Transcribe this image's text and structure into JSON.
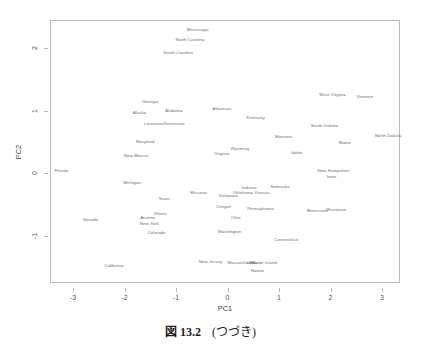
{
  "caption": {
    "figure_word": "図",
    "number": "13.2",
    "note": "(つづき)"
  },
  "chart_data": {
    "type": "scatter",
    "title": "",
    "xlabel": "PC1",
    "ylabel": "PC2",
    "xlim": [
      -3.45,
      3.35
    ],
    "ylim": [
      -1.75,
      2.45
    ],
    "xticks": [
      -3,
      -2,
      -1,
      0,
      1,
      2,
      3
    ],
    "xticklabels": [
      "-3",
      "-2",
      "-1",
      "0",
      "1",
      "2",
      "3"
    ],
    "yticks": [
      -1,
      0,
      1,
      2
    ],
    "yticklabels": [
      "-1",
      "0",
      "1",
      "2"
    ],
    "grid": false,
    "legend": false,
    "marker": "text-label",
    "points": [
      {
        "label": "Mississippi",
        "x": -0.6,
        "y": 2.31
      },
      {
        "label": "North Carolina",
        "x": -0.75,
        "y": 2.14
      },
      {
        "label": "South Carolina",
        "x": -0.98,
        "y": 1.94
      },
      {
        "label": "West Virginia",
        "x": 2.02,
        "y": 1.27
      },
      {
        "label": "Vermont",
        "x": 2.65,
        "y": 1.24
      },
      {
        "label": "Georgia",
        "x": -1.52,
        "y": 1.15
      },
      {
        "label": "Alabama",
        "x": -1.06,
        "y": 1.02
      },
      {
        "label": "Arkansas",
        "x": -0.13,
        "y": 1.05
      },
      {
        "label": "Alaska",
        "x": -1.73,
        "y": 0.98
      },
      {
        "label": "Kentucky",
        "x": 0.53,
        "y": 0.9
      },
      {
        "label": "Louisiana",
        "x": -1.45,
        "y": 0.81
      },
      {
        "label": "Tennessee",
        "x": -1.06,
        "y": 0.81
      },
      {
        "label": "South Dakota",
        "x": 1.86,
        "y": 0.78
      },
      {
        "label": "North Dakota",
        "x": 3.1,
        "y": 0.62
      },
      {
        "label": "Montana",
        "x": 1.07,
        "y": 0.6
      },
      {
        "label": "Maryland",
        "x": -1.62,
        "y": 0.52
      },
      {
        "label": "Maine",
        "x": 2.26,
        "y": 0.5
      },
      {
        "label": "Wyoming",
        "x": 0.22,
        "y": 0.4
      },
      {
        "label": "Idaho",
        "x": 1.32,
        "y": 0.34
      },
      {
        "label": "Virginia",
        "x": -0.13,
        "y": 0.32
      },
      {
        "label": "New Mexico",
        "x": -1.8,
        "y": 0.29
      },
      {
        "label": "Florida",
        "x": -3.25,
        "y": 0.05
      },
      {
        "label": "New Hampshire",
        "x": 2.04,
        "y": 0.06
      },
      {
        "label": "Iowa",
        "x": 2.0,
        "y": -0.04
      },
      {
        "label": "Michigan",
        "x": -1.87,
        "y": -0.14
      },
      {
        "label": "Indiana",
        "x": 0.4,
        "y": -0.21
      },
      {
        "label": "Nebraska",
        "x": 1.0,
        "y": -0.2
      },
      {
        "label": "Kansas",
        "x": 0.66,
        "y": -0.29
      },
      {
        "label": "Oklahoma",
        "x": 0.28,
        "y": -0.3
      },
      {
        "label": "Delaware",
        "x": 0.0,
        "y": -0.34
      },
      {
        "label": "Missouri",
        "x": -0.58,
        "y": -0.3
      },
      {
        "label": "Texas",
        "x": -1.25,
        "y": -0.4
      },
      {
        "label": "Oregon",
        "x": -0.1,
        "y": -0.52
      },
      {
        "label": "Pennsylvania",
        "x": 0.62,
        "y": -0.55
      },
      {
        "label": "Minnesota",
        "x": 1.72,
        "y": -0.58
      },
      {
        "label": "Wisconsin",
        "x": 2.09,
        "y": -0.57
      },
      {
        "label": "Illinois",
        "x": -1.32,
        "y": -0.63
      },
      {
        "label": "Nevada",
        "x": -2.68,
        "y": -0.73
      },
      {
        "label": "Arizona",
        "x": -1.57,
        "y": -0.7
      },
      {
        "label": "Ohio",
        "x": 0.14,
        "y": -0.7
      },
      {
        "label": "New York",
        "x": -1.54,
        "y": -0.79
      },
      {
        "label": "Colorado",
        "x": -1.4,
        "y": -0.94
      },
      {
        "label": "Washington",
        "x": 0.02,
        "y": -0.92
      },
      {
        "label": "Connecticut",
        "x": 1.12,
        "y": -1.05
      },
      {
        "label": "California",
        "x": -2.23,
        "y": -1.47
      },
      {
        "label": "New Jersey",
        "x": -0.35,
        "y": -1.4
      },
      {
        "label": "Massachusetts",
        "x": 0.27,
        "y": -1.42
      },
      {
        "label": "Utah",
        "x": 0.44,
        "y": -1.42
      },
      {
        "label": "Rhode Island",
        "x": 0.68,
        "y": -1.42
      },
      {
        "label": "Hawaii",
        "x": 0.56,
        "y": -1.54
      }
    ]
  }
}
